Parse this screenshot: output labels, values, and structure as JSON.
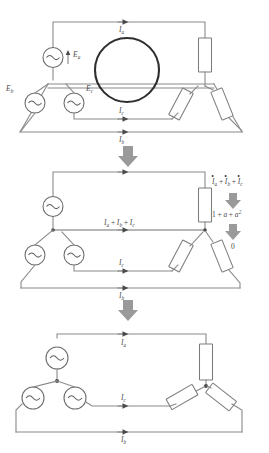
{
  "figure": {
    "background_color": "#ffffff",
    "wire_color": "#8a8a8a",
    "highlight_color": "#2e2e2e",
    "arrow_color": "#9a9a9a",
    "text_color": "#4a4a4a"
  },
  "diagram1": {
    "name": "four-wire wye-wye with neutral highlighted",
    "sources": [
      {
        "id": "source-a",
        "label_main": "E",
        "label_sub": "a",
        "has_polarity_arrow": true
      },
      {
        "id": "source-b",
        "label_main": "E",
        "label_sub": "b",
        "has_polarity_arrow": true
      },
      {
        "id": "source-c",
        "label_main": "E",
        "label_sub": "c",
        "has_polarity_arrow": true
      }
    ],
    "currents": [
      {
        "id": "current-a",
        "label_main": "I",
        "label_sub": "a"
      },
      {
        "id": "current-c",
        "label_main": "I",
        "label_sub": "c"
      },
      {
        "id": "current-b",
        "label_main": "I",
        "label_sub": "b"
      }
    ],
    "loads": [
      {
        "id": "load-a"
      },
      {
        "id": "load-c"
      },
      {
        "id": "load-b"
      }
    ],
    "highlight": {
      "id": "neutral-highlight-circle",
      "shape": "circle"
    }
  },
  "transition1": {
    "id": "transition-arrow-1",
    "glyph": "down-block-arrow"
  },
  "diagram2": {
    "name": "wye-wye showing neutral current summation",
    "sources": [
      {
        "id": "source-a",
        "label_main": "E",
        "label_sub": "a"
      },
      {
        "id": "source-b",
        "label_main": "E",
        "label_sub": "b"
      },
      {
        "id": "source-c",
        "label_main": "E",
        "label_sub": "c"
      }
    ],
    "currents": [
      {
        "id": "current-c",
        "label_main": "I",
        "label_sub": "c"
      },
      {
        "id": "current-b",
        "label_main": "I",
        "label_sub": "b"
      }
    ],
    "neutral_current_label": {
      "id": "neutral-sum-label",
      "terms": [
        {
          "main": "I",
          "sub": "a"
        },
        {
          "main": "I",
          "sub": "b"
        },
        {
          "main": "I",
          "sub": "c"
        }
      ],
      "operator": "+"
    },
    "derivation": {
      "step1": {
        "id": "phasor-sum",
        "terms": [
          {
            "main": "I",
            "sub": "a",
            "dotted": true
          },
          {
            "main": "I",
            "sub": "b",
            "dotted": true
          },
          {
            "main": "I",
            "sub": "c",
            "dotted": true
          }
        ],
        "operator": "+"
      },
      "step2": {
        "id": "operator-identity",
        "text_parts": [
          "1",
          "+",
          "a",
          "+",
          "a"
        ],
        "exponent": "2"
      },
      "step3": {
        "id": "result-zero",
        "value": "0"
      },
      "arrows": [
        "down-block-arrow",
        "down-block-arrow"
      ]
    }
  },
  "transition2": {
    "id": "transition-arrow-2",
    "glyph": "down-block-arrow"
  },
  "diagram3": {
    "name": "three-wire wye-wye with neutral removed",
    "sources": [
      {
        "id": "source-a"
      },
      {
        "id": "source-b"
      },
      {
        "id": "source-c"
      }
    ],
    "currents": [
      {
        "id": "current-a",
        "label_main": "I",
        "label_sub": "a"
      },
      {
        "id": "current-c",
        "label_main": "I",
        "label_sub": "c"
      },
      {
        "id": "current-b",
        "label_main": "I",
        "label_sub": "b"
      }
    ],
    "loads": [
      {
        "id": "load-a"
      },
      {
        "id": "load-c"
      },
      {
        "id": "load-b"
      }
    ]
  }
}
